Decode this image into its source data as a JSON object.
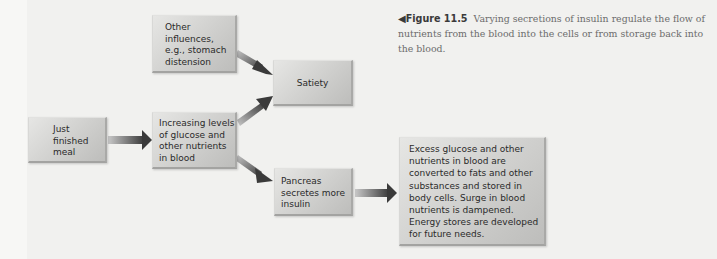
{
  "figure": {
    "number_label": "Figure 11.5",
    "pointer_glyph": "◀",
    "caption": "Varying secretions of insulin regulate the flow of nutrients from the blood into the cells or from storage back into the blood."
  },
  "boxes": {
    "other_influences": "Other\ninfluences,\ne.g., stomach\ndistension",
    "satiety": "Satiety",
    "just_finished_meal": "Just\nfinished\nmeal",
    "increasing_levels": "Increasing levels\nof glucose and\nother nutrients\nin blood",
    "pancreas": "Pancreas\nsecretes more\ninsulin",
    "excess_glucose": "Excess glucose and other\nnutrients in blood are\nconverted to fats and other\nsubstances and stored in\nbody cells. Surge in blood\nnutrients is dampened.\nEnergy stores are developed\nfor future needs."
  },
  "arrows": [
    {
      "from": "just_finished_meal",
      "to": "increasing_levels"
    },
    {
      "from": "other_influences",
      "to": "satiety"
    },
    {
      "from": "increasing_levels",
      "to": "satiety"
    },
    {
      "from": "increasing_levels",
      "to": "pancreas"
    },
    {
      "from": "pancreas",
      "to": "excess_glucose"
    }
  ],
  "colors": {
    "background": "#f7f7f5",
    "box_fill": "#cfcfcd",
    "arrow_dark": "#3c3c3c",
    "caption_text": "#6c6c6c"
  }
}
